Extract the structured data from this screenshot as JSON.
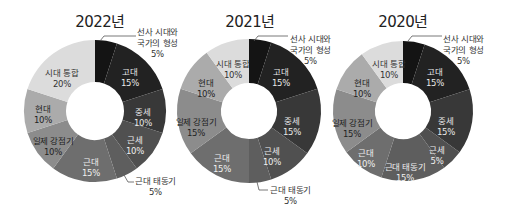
{
  "chart_data": [
    {
      "type": "pie",
      "subtype": "donut",
      "title": "2022년",
      "start_angle": "12 o'clock, clockwise",
      "categories": [
        "선사 시대와 국가의 형성",
        "고대",
        "중세",
        "근세",
        "근대 태동기",
        "근대",
        "일제 강점기",
        "현대",
        "시대 통합"
      ],
      "values": [
        5,
        15,
        10,
        10,
        5,
        15,
        10,
        10,
        20
      ],
      "unit": "%"
    },
    {
      "type": "pie",
      "subtype": "donut",
      "title": "2021년",
      "start_angle": "12 o'clock, clockwise",
      "categories": [
        "선사 시대와 국가의 형성",
        "고대",
        "중세",
        "근세",
        "근대 태동기",
        "근대",
        "일제 강점기",
        "현대",
        "시대 통합"
      ],
      "values": [
        5,
        15,
        15,
        10,
        5,
        15,
        15,
        10,
        10
      ],
      "unit": "%"
    },
    {
      "type": "pie",
      "subtype": "donut",
      "title": "2020년",
      "start_angle": "12 o'clock, clockwise",
      "categories": [
        "선사 시대와 국가의 형성",
        "고대",
        "중세",
        "근세",
        "근대 태동기",
        "근대",
        "일제 강점기",
        "현대",
        "시대 통합"
      ],
      "values": [
        5,
        15,
        15,
        5,
        15,
        10,
        15,
        10,
        10
      ],
      "unit": "%"
    }
  ],
  "colors": [
    "#141414",
    "#222222",
    "#383838",
    "#505050",
    "#5e5e5e",
    "#6e6e6e",
    "#8c8c8c",
    "#ababab",
    "#dcdcdc"
  ],
  "label_colors": [
    "#ffffff",
    "#e8e8e8",
    "#e8e8e8",
    "#eeeeee",
    "#f0f0f0",
    "#f0f0f0",
    "#222222",
    "#222222",
    "#333333"
  ],
  "charts": [
    {
      "title": "2022년",
      "cx": 95,
      "cy": 111,
      "r_outer": 71,
      "r_inner": 29,
      "inner_labels": [
        {
          "idx": 1,
          "lines": [
            "고대",
            "15%"
          ],
          "x": 130,
          "y": 77
        },
        {
          "idx": 2,
          "lines": [
            "중세",
            "10%"
          ],
          "x": 143,
          "y": 117
        },
        {
          "idx": 3,
          "lines": [
            "근세",
            "10%"
          ],
          "x": 135,
          "y": 145
        },
        {
          "idx": 5,
          "lines": [
            "근대",
            "15%"
          ],
          "x": 91,
          "y": 167
        },
        {
          "idx": 6,
          "lines": [
            "일제 강점기",
            "10%"
          ],
          "x": 53,
          "y": 146
        },
        {
          "idx": 7,
          "lines": [
            "현대",
            "10%"
          ],
          "x": 43,
          "y": 114
        },
        {
          "idx": 8,
          "lines": [
            "시대 통합",
            "20%"
          ],
          "x": 62,
          "y": 78
        }
      ],
      "outer_labels": [
        {
          "idx": 0,
          "lines": [
            "선사 시대와",
            "국가의 형성",
            "5%"
          ],
          "x": 137,
          "y": 27,
          "leader": "M100,41 L104,36 L136,36"
        },
        {
          "idx": 4,
          "lines": [
            "근대 태동기",
            "5%"
          ],
          "x": 135,
          "y": 176,
          "leader": "M124,175 L128,182 L134,182"
        }
      ]
    },
    {
      "title": "2021년",
      "cx": 249,
      "cy": 111,
      "r_outer": 72,
      "r_inner": 28,
      "inner_labels": [
        {
          "idx": 1,
          "lines": [
            "고대",
            "15%"
          ],
          "x": 281,
          "y": 77
        },
        {
          "idx": 2,
          "lines": [
            "중세",
            "15%"
          ],
          "x": 292,
          "y": 126
        },
        {
          "idx": 3,
          "lines": [
            "근세",
            "10%"
          ],
          "x": 272,
          "y": 156
        },
        {
          "idx": 5,
          "lines": [
            "근대",
            "15%"
          ],
          "x": 222,
          "y": 163
        },
        {
          "idx": 6,
          "lines": [
            "일제 강점기",
            "15%"
          ],
          "x": 196,
          "y": 127
        },
        {
          "idx": 7,
          "lines": [
            "현대",
            "10%"
          ],
          "x": 206,
          "y": 88
        },
        {
          "idx": 8,
          "lines": [
            "시대 통합",
            "10%"
          ],
          "x": 233,
          "y": 69
        }
      ],
      "outer_labels": [
        {
          "idx": 0,
          "lines": [
            "선사 시대와",
            "국가의 형성",
            "5%"
          ],
          "x": 290,
          "y": 34,
          "leader": "M254,41 L258,36 L288,36"
        },
        {
          "idx": 4,
          "lines": [
            "근대 태동기",
            "5%"
          ],
          "x": 270,
          "y": 185,
          "leader": "M257,182 L259,190 L268,190"
        }
      ]
    },
    {
      "title": "2020년",
      "cx": 403,
      "cy": 111,
      "r_outer": 70,
      "r_inner": 28,
      "inner_labels": [
        {
          "idx": 1,
          "lines": [
            "고대",
            "15%"
          ],
          "x": 435,
          "y": 77
        },
        {
          "idx": 2,
          "lines": [
            "중세",
            "15%"
          ],
          "x": 446,
          "y": 126
        },
        {
          "idx": 3,
          "lines": [
            "근세",
            "5%"
          ],
          "x": 437,
          "y": 155
        },
        {
          "idx": 4,
          "lines": [
            "근대 태동기",
            "15%"
          ],
          "x": 405,
          "y": 172
        },
        {
          "idx": 5,
          "lines": [
            "근대",
            "10%"
          ],
          "x": 366,
          "y": 158
        },
        {
          "idx": 6,
          "lines": [
            "일제 강점기",
            "15%"
          ],
          "x": 352,
          "y": 128
        },
        {
          "idx": 7,
          "lines": [
            "현대",
            "10%"
          ],
          "x": 362,
          "y": 88
        },
        {
          "idx": 8,
          "lines": [
            "시대 통합",
            "10%"
          ],
          "x": 389,
          "y": 69
        }
      ],
      "outer_labels": [
        {
          "idx": 0,
          "lines": [
            "선사 시대와",
            "국가의 형성",
            "5%"
          ],
          "x": 443,
          "y": 34,
          "leader": "M408,41 L412,36 L442,36"
        }
      ]
    }
  ]
}
